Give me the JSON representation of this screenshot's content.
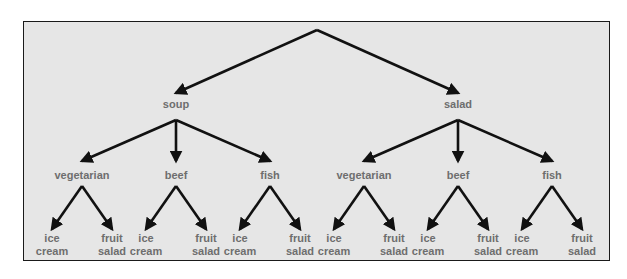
{
  "diagram": {
    "type": "decision-tree",
    "root": {
      "label": "",
      "children": [
        {
          "label": "soup",
          "children": [
            {
              "label": "vegetarian",
              "children": [
                {
                  "label": "ice cream"
                },
                {
                  "label": "fruit salad"
                }
              ]
            },
            {
              "label": "beef",
              "children": [
                {
                  "label": "ice cream"
                },
                {
                  "label": "fruit salad"
                }
              ]
            },
            {
              "label": "fish",
              "children": [
                {
                  "label": "ice cream"
                },
                {
                  "label": "fruit salad"
                }
              ]
            }
          ]
        },
        {
          "label": "salad",
          "children": [
            {
              "label": "vegetarian",
              "children": [
                {
                  "label": "ice cream"
                },
                {
                  "label": "fruit salad"
                }
              ]
            },
            {
              "label": "beef",
              "children": [
                {
                  "label": "ice cream"
                },
                {
                  "label": "fruit salad"
                }
              ]
            },
            {
              "label": "fish",
              "children": [
                {
                  "label": "ice cream"
                },
                {
                  "label": "fruit salad"
                }
              ]
            }
          ]
        }
      ]
    },
    "colors": {
      "background": "#e6e6e6",
      "border": "#1a1a1a",
      "arrow": "#111111",
      "label": "#6e6e6e"
    }
  }
}
